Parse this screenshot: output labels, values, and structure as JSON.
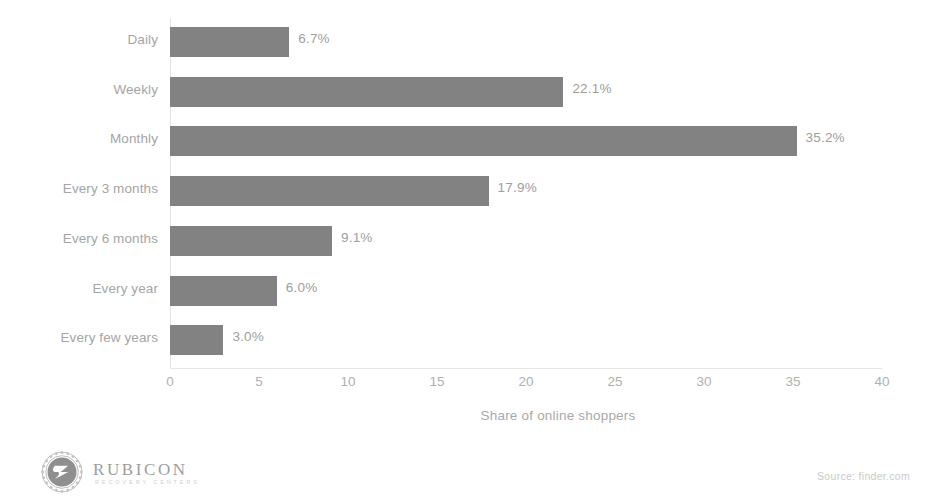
{
  "chart_data": {
    "type": "bar",
    "orientation": "horizontal",
    "title": "",
    "xlabel": "Share of online shoppers",
    "ylabel": "",
    "xlim": [
      0,
      40
    ],
    "xticks": [
      "0",
      "5",
      "10",
      "15",
      "20",
      "25",
      "30",
      "35",
      "40"
    ],
    "grid": false,
    "legend": null,
    "bar_color": "#828282",
    "categories": [
      "Daily",
      "Weekly",
      "Monthly",
      "Every 3 months",
      "Every 6 months",
      "Every year",
      "Every few years"
    ],
    "values": [
      6.7,
      22.1,
      35.2,
      17.9,
      9.1,
      6.0,
      3.0
    ],
    "value_labels": [
      "6.7%",
      "22.1%",
      "35.2%",
      "17.9%",
      "9.1%",
      "6.0%",
      "3.0%"
    ]
  },
  "footer": {
    "logo_wordmark": "RUBICON",
    "logo_tagline": "RECOVERY CENTERS",
    "logo_icon": "rubicon-laurel-wreath-icon",
    "source": "Source: finder.com"
  },
  "colors": {
    "background": "#ffffff",
    "bar": "#828282",
    "text": "#a5a5a5",
    "value_text": "#9e9e9e",
    "tick_text": "#b0b0b0",
    "axis_line": "#e3e3e3"
  }
}
